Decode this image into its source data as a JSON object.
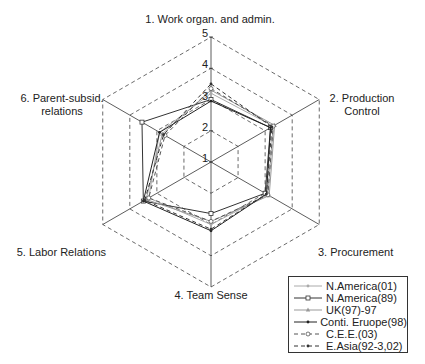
{
  "chart_data": {
    "type": "radar",
    "title": "",
    "axes": [
      "1. Work organ. and admin.",
      "2. Production Control",
      "3. Procurement",
      "4. Team Sense",
      "5. Labor Relations",
      "6. Parent-subsid. relations"
    ],
    "axis_labels_display": [
      {
        "lines": [
          "1. Work organ. and admin."
        ]
      },
      {
        "lines": [
          "2. Production",
          "Control"
        ]
      },
      {
        "lines": [
          "3. Procurement"
        ]
      },
      {
        "lines": [
          "4. Team Sense"
        ]
      },
      {
        "lines": [
          "5. Labor Relations"
        ]
      },
      {
        "lines": [
          "6. Parent-subsid.",
          "relations"
        ]
      }
    ],
    "rlim": [
      1,
      5
    ],
    "ticks": [
      "1",
      "2",
      "3",
      "4",
      "5"
    ],
    "grid": "dashed hexagons",
    "legend_position": "bottom-right",
    "series": [
      {
        "name": "N.America(01)",
        "values": [
          3.2,
          3.3,
          3.1,
          3.0,
          3.3,
          2.9
        ],
        "color": "#aaaaaa",
        "dash": "",
        "marker": "dot"
      },
      {
        "name": "N.America(89)",
        "values": [
          3.0,
          3.2,
          3.0,
          2.65,
          3.5,
          3.55
        ],
        "color": "#333333",
        "dash": "",
        "marker": "square"
      },
      {
        "name": "UK(97)-97",
        "values": [
          3.3,
          3.35,
          3.15,
          2.9,
          3.4,
          2.8
        ],
        "color": "#999999",
        "dash": "",
        "marker": "triangle"
      },
      {
        "name": "Conti. Eruope(98)",
        "values": [
          2.95,
          3.2,
          3.05,
          3.2,
          3.5,
          2.9
        ],
        "color": "#222222",
        "dash": "",
        "marker": "dot"
      },
      {
        "name": "C.E.E.(03)",
        "values": [
          3.35,
          3.3,
          3.1,
          2.9,
          3.3,
          2.7
        ],
        "color": "#555555",
        "dash": "4,3",
        "marker": "circle"
      },
      {
        "name": "E.Asia(92-3,02)",
        "values": [
          3.5,
          3.25,
          3.05,
          3.15,
          3.45,
          2.75
        ],
        "color": "#333333",
        "dash": "4,3",
        "marker": "dot"
      }
    ]
  }
}
